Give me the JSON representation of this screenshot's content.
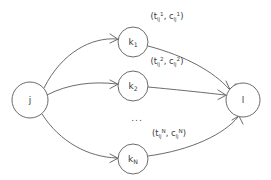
{
  "diagram": {
    "background_color": "#ffffff",
    "stroke_color": "#5a5a5a",
    "text_color": "#3a3a3a",
    "nodes": [
      {
        "id": "j",
        "label": "j",
        "sub": "",
        "cx": 30,
        "cy": 100,
        "r": 18
      },
      {
        "id": "k1",
        "label": "k",
        "sub": "1",
        "cx": 133,
        "cy": 42,
        "r": 15
      },
      {
        "id": "k2",
        "label": "k",
        "sub": "2",
        "cx": 133,
        "cy": 86,
        "r": 15
      },
      {
        "id": "kN",
        "label": "k",
        "sub": "N",
        "cx": 133,
        "cy": 159,
        "r": 15
      },
      {
        "id": "l",
        "label": "l",
        "sub": "",
        "cx": 243,
        "cy": 100,
        "r": 17
      }
    ],
    "node_labels": {
      "j": "j",
      "k1_base": "k",
      "k1_sub": "1",
      "k2_base": "k",
      "k2_sub": "2",
      "kN_base": "k",
      "kN_sub": "N",
      "l": "l"
    },
    "edge_labels": [
      {
        "id": "label-1",
        "text": "(t_lj^1, c_lj^1)",
        "open_paren": "(",
        "t_base": "t",
        "t_sub": "lj",
        "t_sup": "1",
        "separator": ", ",
        "c_base": "c",
        "c_sub": "lj",
        "c_sup": "1",
        "close_paren": ")",
        "x": 167,
        "y": 16
      },
      {
        "id": "label-2",
        "text": "(t_lj^2, c_lj^2)",
        "open_paren": "(",
        "t_base": "t",
        "t_sub": "lj",
        "t_sup": "2",
        "separator": ", ",
        "c_base": "c",
        "c_sub": "lj",
        "c_sup": "2",
        "close_paren": ")",
        "x": 167,
        "y": 61
      },
      {
        "id": "label-N",
        "text": "(t_lj^N, c_lj^N)",
        "open_paren": "(",
        "t_base": "t",
        "t_sub": "lj",
        "t_sup": "N",
        "separator": ", ",
        "c_base": "c",
        "c_sub": "lj",
        "c_sup": "N",
        "close_paren": ")",
        "x": 169,
        "y": 133
      }
    ],
    "ellipsis": {
      "text": "...",
      "x": 137,
      "y": 118
    },
    "edges": [
      {
        "id": "j-to-k1",
        "from": "j",
        "to": "k1",
        "path": "M 44,88 C 62,52 92,37 117,39"
      },
      {
        "id": "j-to-k2",
        "from": "j",
        "to": "k2",
        "path": "M 47,95 C 68,84 93,81 117,84"
      },
      {
        "id": "j-to-kN",
        "from": "j",
        "to": "kN",
        "path": "M 42,114 C 60,142 88,157 117,158"
      },
      {
        "id": "k1-to-l",
        "from": "k1",
        "to": "l",
        "path": "M 148,46 C 186,56 214,72 229,89"
      },
      {
        "id": "k2-to-l",
        "from": "k2",
        "to": "l",
        "path": "M 148,87 C 180,90 208,93 225,95"
      },
      {
        "id": "kN-to-l",
        "from": "kN",
        "to": "l",
        "path": "M 148,156 C 192,150 224,134 238,117"
      }
    ]
  }
}
